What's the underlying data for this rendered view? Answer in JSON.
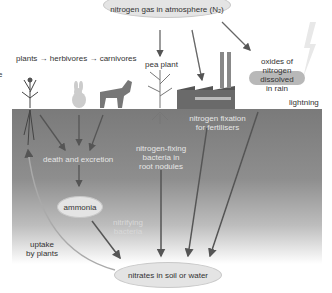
{
  "diagram": {
    "title_node": "nitrogen gas in atmosphere (N₂)",
    "food_chain": {
      "items": [
        "plants",
        "herbivores",
        "carnivores"
      ],
      "arrow": "→"
    },
    "clipped_left_text": "e",
    "labels": {
      "pea_plant": "pea plant",
      "oxides_line1": "oxides of",
      "oxides_line2": "nitrogen",
      "oxides_line3": "dissolved",
      "oxides_line4": "in rain",
      "lightning": "lightning",
      "fixation_line1": "nitrogen fixation",
      "fixation_line2": "for fertilisers",
      "death_excretion": "death and excretion",
      "bacteria_line1": "nitrogen-fixing",
      "bacteria_line2": "bacteria in",
      "bacteria_line3": "root nodules",
      "nitrifying_line1": "nitrifying",
      "nitrifying_line2": "bacteria",
      "uptake_line1": "uptake",
      "uptake_line2": "by plants"
    },
    "nodes": {
      "ammonia": "ammonia",
      "nitrates": "nitrates in soil or water"
    },
    "icons": [
      "wildflower-plant-icon",
      "rabbit-icon",
      "fox-icon",
      "pea-plant-icon",
      "factory-icon",
      "lightning-bolt-icon",
      "rain-cloud-icon"
    ],
    "colors": {
      "ground_top": "#7a7a7a",
      "ellipse_fill": "#e4e4e4",
      "arrow": "#555555",
      "text_dark": "#333333",
      "text_light": "#e6e6e6"
    }
  }
}
